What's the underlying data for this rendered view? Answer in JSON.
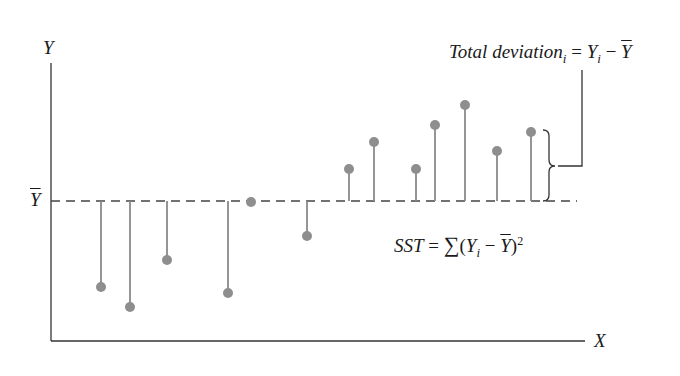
{
  "chart_data": {
    "type": "scatter",
    "title": "",
    "xlabel": "X",
    "ylabel": "Y",
    "mean_label": "Ȳ",
    "grid": false,
    "mean_line": {
      "style": "dashed",
      "y_px": 201
    },
    "points_px": [
      {
        "x": 101,
        "y": 287
      },
      {
        "x": 130,
        "y": 307
      },
      {
        "x": 167,
        "y": 260
      },
      {
        "x": 228,
        "y": 293
      },
      {
        "x": 251,
        "y": 202
      },
      {
        "x": 307,
        "y": 236
      },
      {
        "x": 349,
        "y": 169
      },
      {
        "x": 374,
        "y": 142
      },
      {
        "x": 416,
        "y": 169
      },
      {
        "x": 435,
        "y": 125
      },
      {
        "x": 465,
        "y": 105
      },
      {
        "x": 497,
        "y": 151
      },
      {
        "x": 531,
        "y": 132
      }
    ],
    "annotations": [
      "Total deviation_i = Y_i − Ȳ",
      "SST = Σ(Y_i − Ȳ)^2"
    ]
  },
  "labels": {
    "y_axis": "Y",
    "x_axis": "X",
    "mean_symbol": "Y",
    "total_dev_text": "Total deviation",
    "total_dev_sub": "i",
    "eq": " = ",
    "y_i": "Y",
    "sub_i": "i",
    "minus": " − ",
    "y_bar": "Y",
    "sst_text": "SST",
    "sigma": "∑",
    "open_paren": "(",
    "close_paren": ")",
    "squared": "2"
  },
  "colors": {
    "axis": "#333333",
    "stem": "#8a8a8a",
    "point": "#8e8e8e",
    "dash": "#444444"
  }
}
